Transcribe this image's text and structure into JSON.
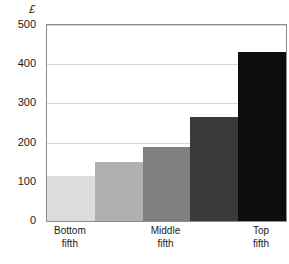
{
  "chart_data": {
    "type": "bar",
    "title": "",
    "subtitle": "",
    "xlabel": "",
    "ylabel": "",
    "unit_label": "£",
    "categories": [
      "Bottom fifth",
      "",
      "Middle fifth",
      "",
      "Top fifth"
    ],
    "category_lines": [
      [
        "Bottom",
        "fifth"
      ],
      [
        "",
        ""
      ],
      [
        "Middle",
        "fifth"
      ],
      [
        "",
        ""
      ],
      [
        "Top",
        "fifth"
      ]
    ],
    "values": [
      115,
      150,
      190,
      265,
      430
    ],
    "bar_colors": [
      "#dcdcdc",
      "#b0b0b0",
      "#808080",
      "#3a3a3a",
      "#0d0d0d"
    ],
    "ylim": [
      0,
      500
    ],
    "yticks": [
      500,
      400,
      300,
      200,
      100,
      0
    ],
    "ytick_labels": [
      "500",
      "400",
      "300",
      "200",
      "100",
      "0"
    ],
    "grid": true,
    "grid_color": "#d8d8d8",
    "legend": false,
    "legend_position": "none",
    "axis_color": "#8c8c8c",
    "background": "#ffffff"
  }
}
